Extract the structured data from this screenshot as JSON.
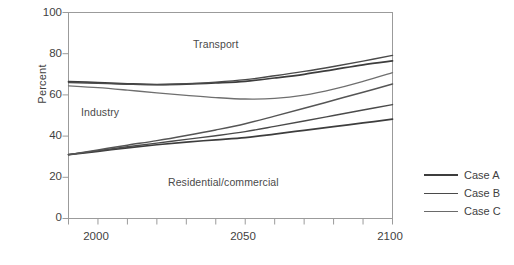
{
  "chart_data": {
    "type": "line",
    "title": "",
    "xlabel": "",
    "ylabel": "Percent",
    "xlim": [
      1990,
      2100
    ],
    "ylim": [
      0,
      100
    ],
    "grid": false,
    "legend_position": "right",
    "x_tick_labels": [
      "2000",
      "2050",
      "2100"
    ],
    "x_tick_values": [
      2000,
      2050,
      2100
    ],
    "x_minor_ticks": [
      1990,
      2000,
      2010,
      2020,
      2030,
      2040,
      2050,
      2060,
      2070,
      2080,
      2090,
      2100
    ],
    "y_tick_labels": [
      "0",
      "20",
      "40",
      "60",
      "80",
      "100"
    ],
    "y_tick_values": [
      0,
      20,
      40,
      60,
      80,
      100
    ],
    "region_labels": [
      {
        "text": "Transport",
        "x": 2050,
        "y": 86
      },
      {
        "text": "Industry",
        "x": 2002,
        "y": 48
      },
      {
        "text": "Residential/commercial",
        "x": 2038,
        "y": 21
      }
    ],
    "x": [
      1990,
      2000,
      2010,
      2020,
      2030,
      2040,
      2050,
      2060,
      2070,
      2080,
      2090,
      2100
    ],
    "series": [
      {
        "name": "Case A upper",
        "boundary": "transport",
        "case": "Case A",
        "color": "#3d3d3d",
        "width": 1.7,
        "values": [
          66.5,
          66.0,
          65.4,
          65.0,
          65.2,
          65.8,
          66.6,
          68.2,
          70.0,
          72.3,
          74.6,
          76.5
        ]
      },
      {
        "name": "Case B upper",
        "boundary": "transport",
        "case": "Case B",
        "color": "#4a4a4a",
        "width": 1.4,
        "values": [
          66.0,
          65.6,
          65.2,
          65.0,
          65.4,
          66.2,
          67.4,
          69.3,
          71.4,
          73.8,
          76.4,
          79.2
        ]
      },
      {
        "name": "Case C upper",
        "boundary": "transport",
        "case": "Case C",
        "color": "#6f6f6f",
        "width": 1.3,
        "values": [
          64.4,
          63.5,
          62.3,
          61.0,
          59.8,
          58.7,
          58.0,
          58.3,
          59.9,
          62.8,
          66.6,
          70.8
        ]
      },
      {
        "name": "Case A lower",
        "boundary": "residential",
        "case": "Case A",
        "color": "#3d3d3d",
        "width": 1.7,
        "values": [
          31.0,
          32.6,
          34.3,
          35.8,
          37.1,
          38.2,
          39.3,
          41.0,
          42.8,
          44.6,
          46.4,
          48.2
        ]
      },
      {
        "name": "Case B lower",
        "boundary": "residential",
        "case": "Case B",
        "color": "#4a4a4a",
        "width": 1.4,
        "values": [
          31.0,
          32.9,
          34.8,
          36.6,
          38.4,
          40.2,
          42.2,
          44.7,
          47.3,
          50.0,
          52.7,
          55.3
        ]
      },
      {
        "name": "Case C lower",
        "boundary": "residential",
        "case": "Case C",
        "color": "#555555",
        "width": 1.5,
        "values": [
          31.0,
          33.3,
          35.6,
          37.8,
          40.3,
          43.0,
          46.0,
          49.7,
          53.5,
          57.4,
          61.3,
          65.3
        ]
      }
    ],
    "legend": [
      {
        "label": "Case A",
        "color": "#3d3d3d",
        "width": 2.2
      },
      {
        "label": "Case B",
        "color": "#4a4a4a",
        "width": 1.7
      },
      {
        "label": "Case C",
        "color": "#6a6a6a",
        "width": 1.5
      }
    ]
  }
}
